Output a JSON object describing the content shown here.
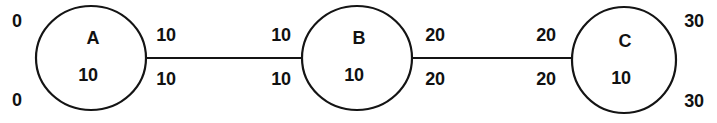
{
  "diagram": {
    "type": "node-link-diagram",
    "stroke_color": "#141414",
    "background_color": "#ffffff",
    "nodes": [
      {
        "id": "A",
        "label": "A",
        "value": "10",
        "cx": 91,
        "cy": 58,
        "rx": 55,
        "ry": 52
      },
      {
        "id": "B",
        "label": "B",
        "value": "10",
        "cx": 357,
        "cy": 58,
        "rx": 55,
        "ry": 52
      },
      {
        "id": "C",
        "label": "C",
        "value": "10",
        "cx": 624,
        "cy": 60,
        "rx": 52,
        "ry": 53
      }
    ],
    "edges": [
      {
        "id": "A-B",
        "from": "A",
        "to": "B",
        "x1": 146,
        "x2": 302,
        "y": 58,
        "labels": {
          "source_top": "10",
          "target_top": "10",
          "source_bottom": "10",
          "target_bottom": "10"
        }
      },
      {
        "id": "B-C",
        "from": "B",
        "to": "C",
        "x1": 412,
        "x2": 572,
        "y": 58,
        "labels": {
          "source_top": "20",
          "target_top": "20",
          "source_bottom": "20",
          "target_bottom": "20"
        }
      }
    ],
    "boundary_labels": {
      "left_top": "0",
      "left_bottom": "0",
      "right_top": "30",
      "right_bottom": "30"
    },
    "label_positions": {
      "edge_ab_top_left": {
        "x": 166,
        "y": 35
      },
      "edge_ab_top_right": {
        "x": 281,
        "y": 35
      },
      "edge_ab_bottom_left": {
        "x": 166,
        "y": 79
      },
      "edge_ab_bottom_right": {
        "x": 281,
        "y": 79
      },
      "edge_bc_top_left": {
        "x": 435,
        "y": 35
      },
      "edge_bc_top_right": {
        "x": 546,
        "y": 35
      },
      "edge_bc_bottom_left": {
        "x": 435,
        "y": 79
      },
      "edge_bc_bottom_right": {
        "x": 546,
        "y": 79
      },
      "left_top": {
        "x": 17,
        "y": 21
      },
      "left_bottom": {
        "x": 17,
        "y": 100
      },
      "right_top": {
        "x": 694,
        "y": 21
      },
      "right_bottom": {
        "x": 694,
        "y": 101
      },
      "node_a_letter": {
        "x": 93,
        "y": 38
      },
      "node_a_value": {
        "x": 88,
        "y": 75
      },
      "node_b_letter": {
        "x": 359,
        "y": 38
      },
      "node_b_value": {
        "x": 354,
        "y": 75
      },
      "node_c_letter": {
        "x": 625,
        "y": 41
      },
      "node_c_value": {
        "x": 621,
        "y": 78
      }
    }
  }
}
